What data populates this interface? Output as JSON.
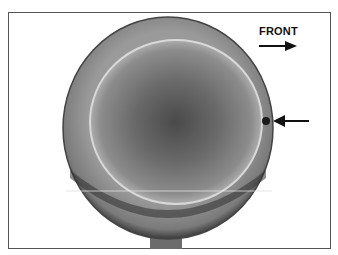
{
  "figure": {
    "labels": {
      "front": "FRONT"
    },
    "annotations": [
      {
        "type": "arrow",
        "direction": "right",
        "meaning": "front-direction-indicator"
      },
      {
        "type": "arrow",
        "direction": "left",
        "meaning": "points-to-notch-on-piston-edge"
      }
    ],
    "colors": {
      "border": "#555555",
      "background": "#ffffff",
      "text": "#111111"
    }
  }
}
